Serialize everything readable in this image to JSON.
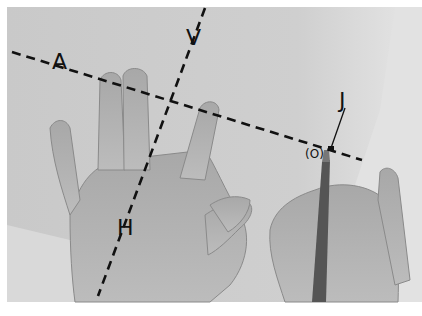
{
  "figure": {
    "labels": {
      "a": "A",
      "v": "V",
      "h": "H",
      "j": "J",
      "o": "(O)"
    },
    "lines": [
      {
        "name": "A-line",
        "style": "dashed",
        "from": [
          12,
          52
        ],
        "to": [
          362,
          160
        ]
      },
      {
        "name": "V-H-line",
        "style": "dashed",
        "from": [
          205,
          8
        ],
        "to": [
          98,
          296
        ]
      },
      {
        "name": "J-pointer",
        "style": "solid",
        "from": [
          345,
          108
        ],
        "to": [
          331,
          148
        ]
      }
    ],
    "colors": {
      "background": "#d2d2d2",
      "border": "#ffffff",
      "line": "#111111"
    }
  }
}
